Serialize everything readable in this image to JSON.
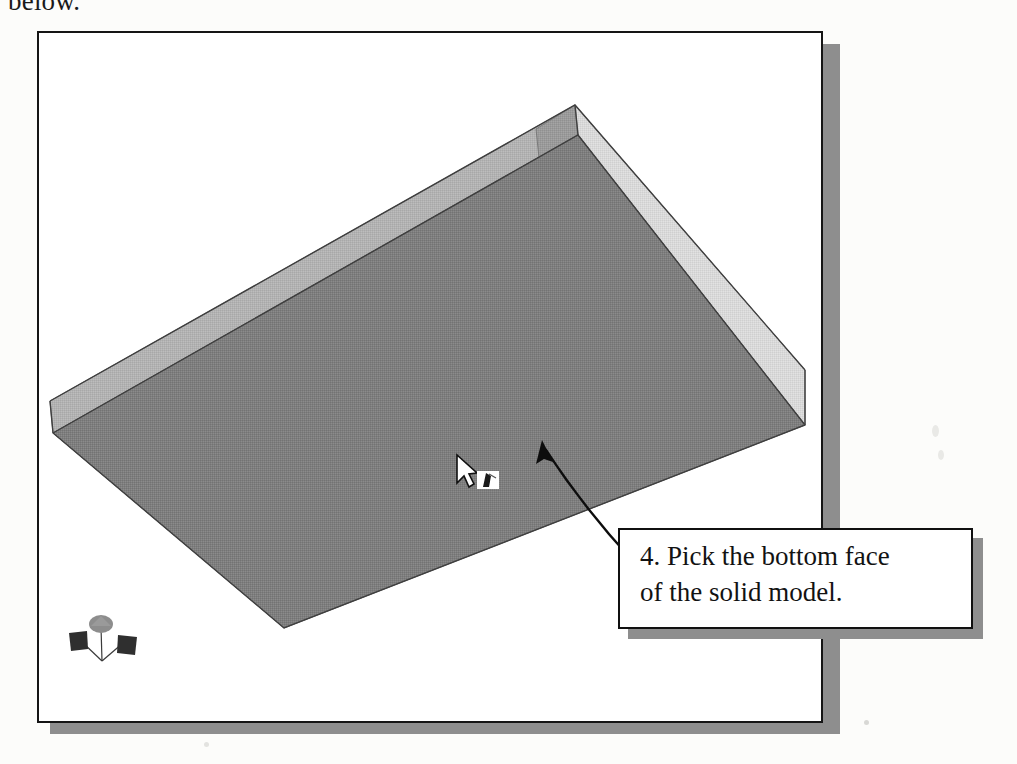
{
  "page": {
    "top_caption": "below.",
    "background_color": "#fcfcfa"
  },
  "cad_window": {
    "name": "cad-viewport",
    "border_color": "#151515",
    "shadow_color": "#8e8e8e",
    "background_color": "#ffffff"
  },
  "model": {
    "label": "solid-model-box",
    "description": "Shaded 3D rectangular solid model viewed from above, open top, showing bottom face and two side walls",
    "faces": {
      "bottom_face_color": "#7e7e7e",
      "left_wall_color": "#b2b2b2",
      "right_wall_color": "#d9d9d9",
      "back_inner_wall_color": "#9a9a9a",
      "edge_color": "#4a4a4a"
    }
  },
  "ucs_icon": {
    "label": "ucs-axis-icon",
    "axes": [
      "X",
      "Y",
      "Z"
    ],
    "color": "#3a3a3a"
  },
  "cursor": {
    "label": "crosshair-pickbox-cursor",
    "arrow_color": "#ffffff",
    "arrow_outline": "#101010",
    "pickbox_color": "#ffffff"
  },
  "callout": {
    "line1": "4. Pick the bottom face",
    "line2": "of the solid model.",
    "step_number": "4",
    "border_color": "#101010",
    "shadow_color": "#8e8e8e",
    "background_color": "#ffffff"
  },
  "leader_arrow": {
    "label": "leader-arrow",
    "color": "#0d0d0d",
    "points_from": "callout-box",
    "points_to": "bottom-face-of-model"
  }
}
